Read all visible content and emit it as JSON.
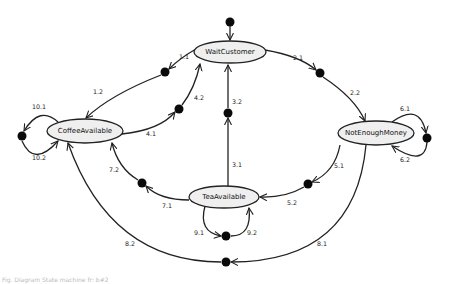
{
  "diagram": {
    "type": "state-machine",
    "initial": {
      "x": 230,
      "y": 22,
      "target": "WaitCustomer"
    },
    "states": [
      {
        "id": "WaitCustomer",
        "label": "WaitCustomer",
        "cx": 230,
        "cy": 52,
        "rx": 36,
        "ry": 11
      },
      {
        "id": "CoffeeAvailable",
        "label": "CoffeeAvailable",
        "cx": 85,
        "cy": 131,
        "rx": 38,
        "ry": 12
      },
      {
        "id": "NotEnoughMoney",
        "label": "NotEnoughMoney",
        "cx": 376,
        "cy": 133,
        "rx": 38,
        "ry": 12
      },
      {
        "id": "TeaAvailable",
        "label": "TeaAvailable",
        "cx": 224,
        "cy": 197,
        "rx": 35,
        "ry": 11
      }
    ],
    "junctions": [
      {
        "id": "j1",
        "x": 165,
        "y": 72
      },
      {
        "id": "j2",
        "x": 320,
        "y": 73
      },
      {
        "id": "j3",
        "x": 228,
        "y": 113
      },
      {
        "id": "j4",
        "x": 179,
        "y": 109
      },
      {
        "id": "j5",
        "x": 308,
        "y": 184
      },
      {
        "id": "j6",
        "x": 427,
        "y": 138
      },
      {
        "id": "j7",
        "x": 142,
        "y": 183
      },
      {
        "id": "j8",
        "x": 226,
        "y": 262
      },
      {
        "id": "j9",
        "x": 226,
        "y": 236
      },
      {
        "id": "j10",
        "x": 22,
        "y": 136
      }
    ],
    "transitions": [
      {
        "label": "1.1",
        "x": 184,
        "y": 57
      },
      {
        "label": "1.2",
        "x": 98,
        "y": 92
      },
      {
        "label": "2.1",
        "x": 298,
        "y": 58
      },
      {
        "label": "2.2",
        "x": 355,
        "y": 93
      },
      {
        "label": "3.1",
        "x": 237,
        "y": 165
      },
      {
        "label": "3.2",
        "x": 237,
        "y": 102
      },
      {
        "label": "4.1",
        "x": 151,
        "y": 134
      },
      {
        "label": "4.2",
        "x": 199,
        "y": 98
      },
      {
        "label": "5.1",
        "x": 339,
        "y": 166
      },
      {
        "label": "5.2",
        "x": 292,
        "y": 203
      },
      {
        "label": "6.1",
        "x": 405,
        "y": 109
      },
      {
        "label": "6.2",
        "x": 405,
        "y": 160
      },
      {
        "label": "7.1",
        "x": 167,
        "y": 206
      },
      {
        "label": "7.2",
        "x": 114,
        "y": 170
      },
      {
        "label": "8.1",
        "x": 322,
        "y": 244
      },
      {
        "label": "8.2",
        "x": 130,
        "y": 244
      },
      {
        "label": "9.1",
        "x": 199,
        "y": 233
      },
      {
        "label": "9.2",
        "x": 252,
        "y": 233
      },
      {
        "label": "10.1",
        "x": 39,
        "y": 107
      },
      {
        "label": "10.2",
        "x": 39,
        "y": 158
      }
    ]
  },
  "footer": {
    "text": "Fig. Diagram State machine fr: b#2"
  }
}
